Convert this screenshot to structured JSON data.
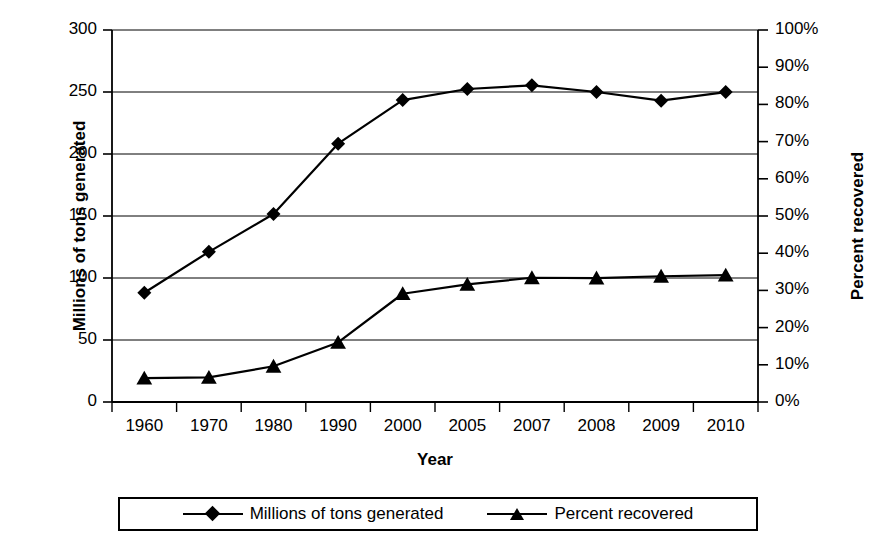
{
  "chart_data": {
    "type": "line",
    "title": "",
    "xlabel": "Year",
    "categories": [
      "1960",
      "1970",
      "1980",
      "1990",
      "2000",
      "2005",
      "2007",
      "2008",
      "2009",
      "2010"
    ],
    "grid": true,
    "legend_position": "bottom",
    "axes": {
      "left": {
        "label": "Millions of tons generated",
        "ticks": [
          "0",
          "50",
          "100",
          "150",
          "200",
          "250",
          "300"
        ],
        "min": 0,
        "max": 300
      },
      "right": {
        "label": "Percent recovered",
        "ticks": [
          "0%",
          "10%",
          "20%",
          "30%",
          "40%",
          "50%",
          "60%",
          "70%",
          "80%",
          "90%",
          "100%"
        ],
        "min": 0,
        "max": 100
      },
      "x": {
        "label": "Year"
      }
    },
    "series": [
      {
        "name": "Millions of tons generated",
        "axis": "left",
        "marker": "diamond",
        "color": "#000000",
        "values": [
          88.1,
          121.1,
          151.6,
          208.3,
          243.5,
          252.4,
          255.4,
          250.0,
          243.0,
          249.9
        ]
      },
      {
        "name": "Percent recovered",
        "axis": "right",
        "marker": "triangle",
        "color": "#000000",
        "values": [
          6.4,
          6.6,
          9.6,
          16.0,
          29.1,
          31.6,
          33.4,
          33.3,
          33.8,
          34.1
        ]
      }
    ]
  },
  "legend": {
    "entries": [
      {
        "label": "Millions of tons generated",
        "marker": "diamond"
      },
      {
        "label": "Percent recovered",
        "marker": "triangle"
      }
    ]
  }
}
